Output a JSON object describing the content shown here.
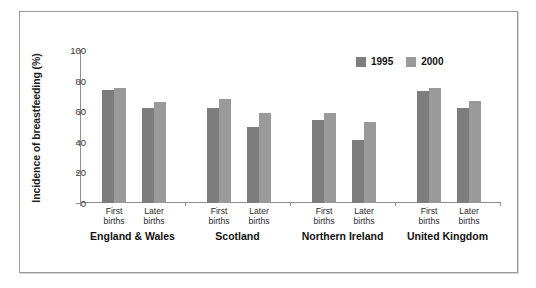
{
  "top_sliver_text": "",
  "chart_data": {
    "type": "bar",
    "title": "",
    "xlabel": "",
    "ylabel": "Incidence of breastfeeding (%)",
    "ylim": [
      0,
      100
    ],
    "yticks": [
      0,
      20,
      40,
      60,
      80,
      100
    ],
    "ytick_labels": [
      "0",
      "20",
      "40",
      "60",
      "80",
      "100"
    ],
    "grid": false,
    "legend_position": "top-right",
    "legend": [
      "1995",
      "2000"
    ],
    "group_labels": [
      "England & Wales",
      "Scotland",
      "Northern Ireland",
      "United Kingdom"
    ],
    "categories": [
      "England & Wales / First births",
      "England & Wales / Later births",
      "Scotland / First births",
      "Scotland / Later births",
      "Northern Ireland / First births",
      "Northern Ireland / Later births",
      "United Kingdom / First births",
      "United Kingdom / Later births"
    ],
    "subcategory_labels": [
      "First births",
      "Later births"
    ],
    "series": [
      {
        "name": "1995",
        "color": "#7d7d7d",
        "values": [
          74,
          62,
          62,
          50,
          54,
          41,
          73,
          62
        ]
      },
      {
        "name": "2000",
        "color": "#9a9a9a",
        "values": [
          75,
          66,
          68,
          59,
          59,
          53,
          75,
          67
        ]
      }
    ],
    "groups": [
      {
        "label": "England & Wales",
        "pairs": [
          {
            "label_line1": "First",
            "label_line2": "births",
            "v1995": 74,
            "v2000": 75
          },
          {
            "label_line1": "Later",
            "label_line2": "births",
            "v1995": 62,
            "v2000": 66
          }
        ]
      },
      {
        "label": "Scotland",
        "pairs": [
          {
            "label_line1": "First",
            "label_line2": "births",
            "v1995": 62,
            "v2000": 68
          },
          {
            "label_line1": "Later",
            "label_line2": "births",
            "v1995": 50,
            "v2000": 59
          }
        ]
      },
      {
        "label": "Northern Ireland",
        "pairs": [
          {
            "label_line1": "First",
            "label_line2": "births",
            "v1995": 54,
            "v2000": 59
          },
          {
            "label_line1": "Later",
            "label_line2": "births",
            "v1995": 41,
            "v2000": 53
          }
        ]
      },
      {
        "label": "United Kingdom",
        "pairs": [
          {
            "label_line1": "First",
            "label_line2": "births",
            "v1995": 73,
            "v2000": 75
          },
          {
            "label_line1": "Later",
            "label_line2": "births",
            "v1995": 62,
            "v2000": 67
          }
        ]
      }
    ]
  }
}
